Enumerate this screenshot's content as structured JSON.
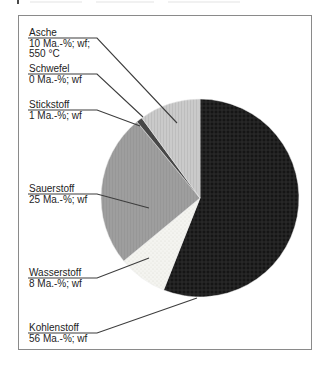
{
  "chart_data": {
    "type": "pie",
    "title": "",
    "unit": "Ma.-%; wf",
    "start_angle_deg": 0,
    "direction": "clockwise",
    "slices": [
      {
        "name": "Kohlenstoff",
        "value": 56,
        "lines": [
          "56 Ma.-%; wf"
        ],
        "color": "#1a1a1a",
        "texture": "weave"
      },
      {
        "name": "Wasserstoff",
        "value": 8,
        "lines": [
          "8 Ma.-%; wf"
        ],
        "color": "#f4f4f0",
        "texture": "dots"
      },
      {
        "name": "Sauerstoff",
        "value": 25,
        "lines": [
          "25 Ma.-%; wf"
        ],
        "color": "#9e9e9e",
        "texture": "mid"
      },
      {
        "name": "Stickstoff",
        "value": 1,
        "lines": [
          "1 Ma.-%; wf"
        ],
        "color": "#474747",
        "texture": "plain"
      },
      {
        "name": "Schwefel",
        "value": 0,
        "lines": [
          "0 Ma.-%; wf"
        ],
        "color": "#6e6e6e",
        "texture": "plain"
      },
      {
        "name": "Asche",
        "value": 10,
        "lines": [
          "10 Ma.-%; wf;",
          "550 °C"
        ],
        "color": "#c9c9c9",
        "texture": "vlines"
      }
    ],
    "legend_position": "left-callouts",
    "grid": false
  },
  "colors": {
    "background": "#ffffff",
    "frame_border": "#8a8a8a",
    "leader_line": "#3d3d3d",
    "text": "#1d1d1d"
  }
}
